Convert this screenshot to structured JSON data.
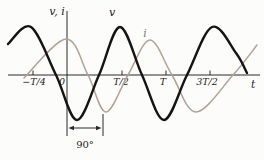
{
  "figure": {
    "background": "#fcfcfa",
    "axis_color": "#2a2a2a",
    "y_axis_label": "v, i",
    "x_axis_label": "t",
    "origin_label": "0",
    "annotation": {
      "text": "90°",
      "meaning": "phase difference between v and i (i lags v by a quarter period)",
      "x_left_guide": 67,
      "x_right_guide": 103,
      "arrow_y": 128,
      "label_x": 85,
      "label_y": 148,
      "guide_top": 114,
      "guide_bottom": 136
    },
    "axes": {
      "x_axis": {
        "y": 75,
        "x1": 8,
        "x2": 260
      },
      "y_axis": {
        "x": 67,
        "y1": 11,
        "y2": 136
      }
    },
    "x_ticks": [
      {
        "label": "−T/4",
        "x": 33,
        "label_x": 34
      },
      {
        "label": "T/2",
        "x": 122,
        "label_x": 121
      },
      {
        "label": "T",
        "x": 166,
        "label_x": 163
      },
      {
        "label": "3T/2",
        "x": 210,
        "label_x": 207
      }
    ],
    "tick_label_y": 84.5,
    "origin_label_pos": {
      "x": 62,
      "y": 84.5
    },
    "x_axis_label_pos": {
      "x": 253,
      "y": 88
    },
    "y_axis_label_pos": {
      "x": 57,
      "y": 15
    },
    "curves": [
      {
        "name": "v",
        "label": "v",
        "color": "#141414",
        "label_color": "#141414",
        "width": 2.4,
        "label_pos": {
          "x": 112,
          "y": 16
        },
        "points": [
          [
            8,
            44
          ],
          [
            31,
            27
          ],
          [
            56,
            75
          ],
          [
            77,
            120
          ],
          [
            99,
            75
          ],
          [
            120,
            27
          ],
          [
            142,
            75
          ],
          [
            164,
            120
          ],
          [
            187,
            75
          ],
          [
            212,
            27
          ],
          [
            236,
            53
          ],
          [
            247,
            73
          ]
        ]
      },
      {
        "name": "i",
        "label": "i",
        "color": "#b1a294",
        "label_color": "#8d7c68",
        "width": 1.5,
        "label_pos": {
          "x": 145,
          "y": 37
        },
        "points": [
          [
            24,
            78
          ],
          [
            66,
            39
          ],
          [
            88,
            75
          ],
          [
            106,
            112
          ],
          [
            128,
            75
          ],
          [
            150,
            40
          ],
          [
            172,
            75
          ],
          [
            196,
            112
          ],
          [
            233,
            75
          ],
          [
            257,
            45
          ]
        ]
      }
    ]
  },
  "chart_data": {
    "type": "line",
    "title": "",
    "xlabel": "t",
    "ylabel": "v, i",
    "x_ticks": [
      "−T/4",
      "0",
      "T/2",
      "T",
      "3T/2"
    ],
    "x_range": [
      "≈ −0.65T",
      "≈ 2.1T"
    ],
    "grid": false,
    "legend_position": "labels-on-curves",
    "series": [
      {
        "name": "v",
        "style": "thick black sinusoid",
        "formula": "v(t) = −V·sin(2πt/T)",
        "peaks_at": [
          "−T/4",
          "3T/4",
          "7T/4"
        ],
        "minima_at": [
          "T/4",
          "5T/4"
        ],
        "zeros_at": [
          "0",
          "T/2",
          "T",
          "3T/2"
        ],
        "amplitude_rel": 1.0,
        "phase_deg": 0
      },
      {
        "name": "i",
        "style": "thin gray sinusoid",
        "formula": "i(t) = I·cos(2πt/T)",
        "peaks_at": [
          "0",
          "T"
        ],
        "minima_at": [
          "T/2",
          "3T/2"
        ],
        "amplitude_rel": 0.78,
        "phase_deg": -90,
        "relation": "i lags v by 90° (shifted right by T/4)"
      }
    ],
    "annotations": [
      {
        "text": "90°",
        "type": "dimension-arrow",
        "between": [
          "t = 0 guide line",
          "t = T/4 region under i minimum"
        ],
        "position": "below axis"
      }
    ]
  }
}
